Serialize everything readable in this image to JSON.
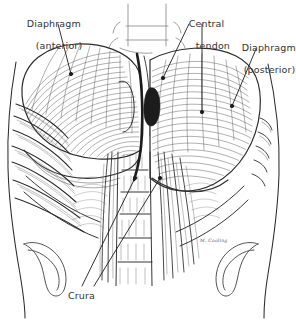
{
  "figure": {
    "medium": "pen-and-ink line drawing",
    "background_color": "#ffffff",
    "ink_color": "#2b2b2b",
    "label_color": "#333333",
    "width": 296,
    "height": 321
  },
  "labels": [
    {
      "id": "diaphragm-anterior",
      "line1": "Diaphragm",
      "line2": "(anterior)",
      "x": 14,
      "y": 7,
      "align": "left"
    },
    {
      "id": "central-tendon",
      "line1": "Central",
      "line2": "tendon",
      "x": 176,
      "y": 7,
      "align": "left"
    },
    {
      "id": "diaphragm-posterior",
      "line1": "Diaphragm",
      "line2": "(posterior)",
      "x": 229,
      "y": 31,
      "align": "left"
    },
    {
      "id": "crura",
      "line1": "Crura",
      "line2": "",
      "x": 68,
      "y": 290,
      "align": "left"
    }
  ],
  "signature": {
    "text": "M. Cooling",
    "x": 200,
    "y": 238
  },
  "leaders": [
    {
      "id": "leader-diaphragm-anterior",
      "from": [
        58,
        24
      ],
      "to": [
        71,
        74
      ],
      "dot": true
    },
    {
      "id": "leader-central-tendon",
      "from": [
        189,
        24
      ],
      "to": [
        163,
        78
      ],
      "dot": true
    },
    {
      "id": "leader-central-tendon-drop",
      "from": [
        202,
        24
      ],
      "to": [
        202,
        112
      ],
      "dot": true
    },
    {
      "id": "leader-diaphragm-posterior",
      "from": [
        256,
        49
      ],
      "to": [
        232,
        106
      ],
      "dot": true
    },
    {
      "id": "leader-crura-left",
      "from": [
        82,
        286
      ],
      "to": [
        135,
        178
      ],
      "dot": true
    },
    {
      "id": "leader-crura-right",
      "from": [
        94,
        286
      ],
      "to": [
        160,
        178
      ],
      "dot": true
    }
  ],
  "anatomy": {
    "parts": [
      "diaphragm anterior dome",
      "diaphragm posterior dome",
      "central tendon",
      "esophageal hiatus",
      "right crus",
      "left crus",
      "rib cage",
      "intercostal muscles",
      "lumbar vertebrae",
      "iliac crest left",
      "iliac crest right",
      "psoas major"
    ]
  }
}
